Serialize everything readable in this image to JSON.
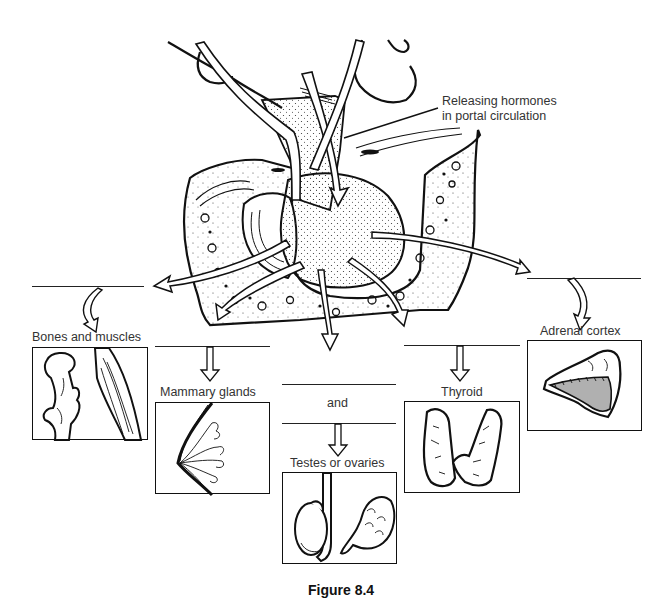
{
  "figure": {
    "callout": {
      "line1": "Releasing hormones",
      "line2": "in portal circulation"
    },
    "targets": [
      {
        "id": "bones",
        "label": "Bones and muscles"
      },
      {
        "id": "mammary",
        "label": "Mammary glands"
      },
      {
        "id": "gonads",
        "connector": "and",
        "label": "Testes or ovaries"
      },
      {
        "id": "thyroid",
        "label": "Thyroid"
      },
      {
        "id": "adrenal",
        "label": "Adrenal cortex"
      }
    ],
    "caption": "Figure 8.4"
  },
  "colors": {
    "ink": "#111111",
    "stipple": "#333333",
    "adrenal_medulla_fill": "#b0b0b0",
    "background": "#ffffff"
  }
}
